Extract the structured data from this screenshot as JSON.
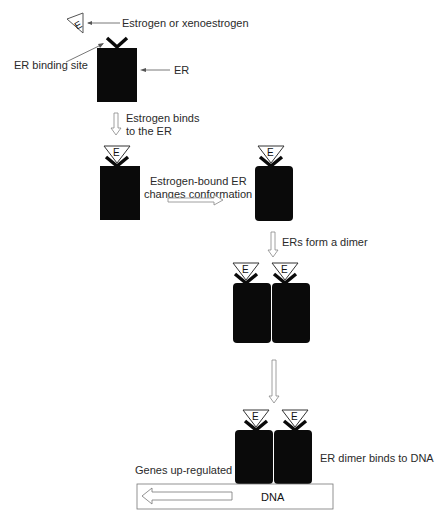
{
  "diagram": {
    "colors": {
      "receptor": "#0a0a0a",
      "outline": "#7a7a7a",
      "text": "#2a2a2a",
      "background": "#ffffff"
    },
    "legend": {
      "ligand_label": "Estrogen or xenoestrogen",
      "binding_site_label": "ER binding site",
      "receptor_label": "ER",
      "ligand_letter": "E"
    },
    "steps": [
      {
        "id": "step1",
        "label_line1": "Estrogen binds",
        "label_line2": "to the ER"
      },
      {
        "id": "step2",
        "label_line1": "Estrogen-bound ER",
        "label_line2": "changes conformation"
      },
      {
        "id": "step3",
        "label_line1": "ERs form a dimer"
      },
      {
        "id": "step4",
        "label_line1": "ER dimer binds to DNA"
      }
    ],
    "dna": {
      "label": "DNA",
      "genes_label": "Genes up-regulated"
    }
  }
}
